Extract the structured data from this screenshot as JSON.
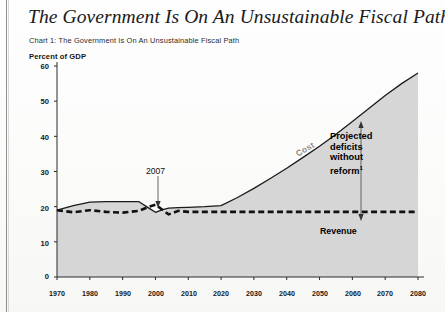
{
  "page": {
    "title": "The Government Is On An Unsustainable Fiscal Path",
    "subtitle": "Chart 1: The Government Is On An Unsustainable Fiscal Path"
  },
  "annotations": {
    "year_marker": "2007",
    "projected": "Projected deficits without reform",
    "projected_footnote": "1",
    "revenue": "Revenue",
    "cost": "Cost"
  },
  "colors": {
    "line": "#1a1a1a",
    "fill": "#d6d6d6",
    "cost_label": "#8a8a8a",
    "text": "#111111",
    "page": "#fdfdfc"
  },
  "chart_data": {
    "type": "area",
    "title": "Chart 1: The Government Is On An Unsustainable Fiscal Path",
    "xlabel": "",
    "ylabel": "Percent of GDP",
    "ylim": [
      0,
      60
    ],
    "xlim": [
      1970,
      2080
    ],
    "grid": false,
    "legend": "inline-labels",
    "yticks": [
      0,
      10,
      20,
      30,
      40,
      50,
      60
    ],
    "xticks": [
      1970,
      1980,
      1990,
      2000,
      2010,
      2020,
      2030,
      2040,
      2050,
      2060,
      2070,
      2080
    ],
    "series": [
      {
        "name": "Cost",
        "style": "solid-line-with-shaded-area",
        "x": [
          1970,
          1975,
          1980,
          1985,
          1990,
          1995,
          1998,
          2000,
          2002,
          2004,
          2007,
          2010,
          2015,
          2020,
          2025,
          2030,
          2035,
          2040,
          2045,
          2050,
          2055,
          2060,
          2065,
          2070,
          2075,
          2080
        ],
        "values": [
          19.0,
          20.3,
          21.3,
          21.4,
          21.4,
          21.4,
          19.6,
          18.4,
          19.1,
          19.6,
          19.7,
          19.8,
          20.0,
          20.3,
          22.6,
          25.2,
          28.0,
          30.9,
          34.0,
          37.2,
          40.6,
          44.2,
          47.9,
          51.6,
          55.0,
          58.0
        ]
      },
      {
        "name": "Revenue",
        "style": "dashed-line",
        "x": [
          1970,
          1975,
          1980,
          1985,
          1990,
          1995,
          1998,
          2000,
          2002,
          2004,
          2007,
          2010,
          2020,
          2030,
          2040,
          2050,
          2060,
          2070,
          2080
        ],
        "values": [
          19.0,
          18.4,
          19.0,
          18.5,
          18.3,
          18.8,
          20.0,
          20.6,
          19.2,
          17.8,
          18.8,
          18.5,
          18.5,
          18.5,
          18.5,
          18.5,
          18.5,
          18.5,
          18.5
        ]
      }
    ],
    "notes": [
      "Shaded area under the Cost line indicates spending as a percent of GDP",
      "Double-headed arrow between Cost and Revenue lines marks projected deficits without reform",
      "Arrow labeled 2007 points to the Cost line at year 2007"
    ]
  }
}
